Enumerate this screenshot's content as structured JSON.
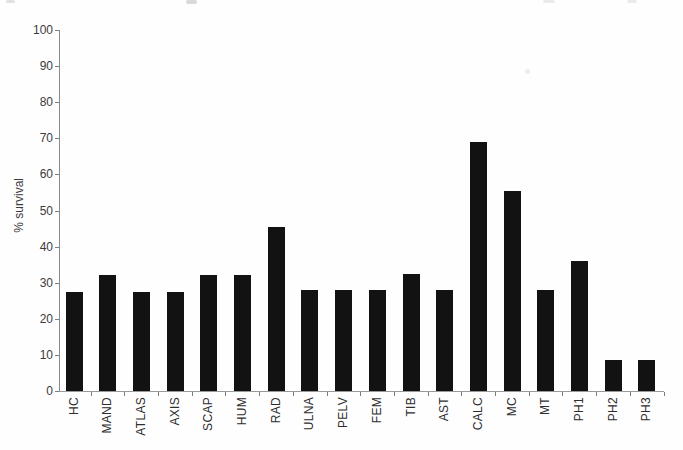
{
  "figure": {
    "ylabel": "% survival"
  },
  "chart_data": {
    "type": "bar",
    "title": "",
    "xlabel": "",
    "ylabel": "% survival",
    "categories": [
      "HC",
      "MAND",
      "ATLAS",
      "AXIS",
      "SCAP",
      "HUM",
      "RAD",
      "ULNA",
      "PELV",
      "FEM",
      "TIB",
      "AST",
      "CALC",
      "MC",
      "MT",
      "PH1",
      "PH2",
      "PH3"
    ],
    "values": [
      27.5,
      32,
      27.5,
      27.5,
      32,
      32,
      45.5,
      28,
      28,
      28,
      32.5,
      28,
      69,
      55.5,
      28,
      36,
      8.5,
      8.5
    ],
    "ylim": [
      0,
      100
    ],
    "yticks": [
      0,
      10,
      20,
      30,
      40,
      50,
      60,
      70,
      80,
      90,
      100
    ],
    "grid": false,
    "legend_position": "none",
    "bar_color": "#121212",
    "axis_color": "#8a8a8a",
    "text_color": "#3c3c3c"
  }
}
